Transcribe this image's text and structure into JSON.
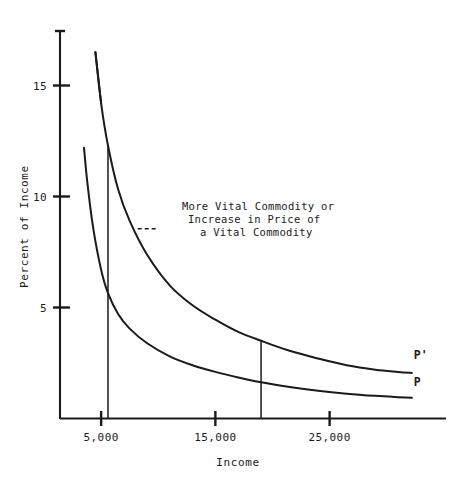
{
  "chart_data": {
    "type": "line",
    "title": "",
    "xlabel": "Income",
    "ylabel": "Percent of Income",
    "xlim": [
      1400,
      33000
    ],
    "ylim": [
      0,
      17.5
    ],
    "grid": false,
    "legend_position": "inline-right-of-curve-end",
    "xticks": [
      {
        "value": 5000,
        "label": "5,000"
      },
      {
        "value": 15000,
        "label": "15,000"
      },
      {
        "value": 25000,
        "label": "25,000"
      }
    ],
    "yticks": [
      {
        "value": 5,
        "label": "5"
      },
      {
        "value": 10,
        "label": "10"
      },
      {
        "value": 15,
        "label": "15"
      }
    ],
    "series": [
      {
        "name": "P'",
        "label": "P'",
        "description": "Higher Engel curve after price increase of a vital commodity",
        "x": [
          4500,
          5000,
          5600,
          6500,
          7500,
          9000,
          11000,
          13000,
          15000,
          17000,
          19000,
          21500,
          24000,
          26500,
          29000,
          31000,
          32200
        ],
        "y": [
          16.5,
          14.2,
          12.3,
          10.3,
          8.9,
          7.4,
          6.0,
          5.1,
          4.45,
          3.9,
          3.5,
          3.05,
          2.7,
          2.4,
          2.2,
          2.1,
          2.05
        ]
      },
      {
        "name": "P",
        "label": "P",
        "description": "Original Engel curve, percent of income spent on the commodity",
        "x": [
          3500,
          3800,
          4300,
          5000,
          5600,
          6500,
          7500,
          9000,
          11000,
          13000,
          15000,
          17000,
          19000,
          21500,
          24000,
          26500,
          29000,
          31000,
          32200
        ],
        "y": [
          12.2,
          10.6,
          8.6,
          6.7,
          5.65,
          4.7,
          4.05,
          3.4,
          2.8,
          2.4,
          2.1,
          1.85,
          1.63,
          1.42,
          1.25,
          1.12,
          1.02,
          0.96,
          0.93
        ]
      }
    ],
    "drop_lines": [
      {
        "name": "drop-line-low-income",
        "x": 5600,
        "y_top": 12.3,
        "y_bottom": 0
      },
      {
        "name": "drop-line-high-income",
        "x": 19000,
        "y_top": 3.5,
        "y_bottom": 0
      }
    ],
    "annotations": [
      {
        "name": "shift-annotation",
        "lines": [
          "More Vital Commodity or",
          "Increase in Price of",
          "a Vital Commodity"
        ],
        "leader": {
          "from_x": 8200,
          "from_y": 8.55,
          "to_x": 9900,
          "to_y": 8.55
        }
      }
    ]
  }
}
